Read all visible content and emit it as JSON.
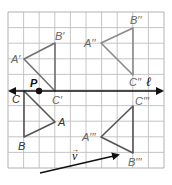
{
  "diagram": {
    "grid": {
      "left": 8,
      "top": 12,
      "cell": 15.6,
      "cols": 10,
      "rows": 10,
      "line_color": "#bfbfbf",
      "border_color": "#a8a8a8"
    },
    "line_l": {
      "label": "ℓ",
      "x1": 10,
      "x2": 162,
      "y": 91,
      "color": "#111111"
    },
    "point_P": {
      "label": "P",
      "x": 39,
      "y": 91
    },
    "vector_v": {
      "label": "v",
      "arrow_glyph": "→",
      "x1": 40,
      "y1": 173,
      "x2": 118,
      "y2": 155
    },
    "triangles": [
      {
        "name": "ABC",
        "color": "#555555",
        "vertices": {
          "A": [
            55,
            122
          ],
          "B": [
            24,
            137
          ],
          "C": [
            24,
            91
          ]
        },
        "labels": {
          "A": "A",
          "B": "B",
          "C": "C"
        }
      },
      {
        "name": "A'B'C'",
        "color": "#707070",
        "vertices": {
          "A": [
            24,
            59
          ],
          "B": [
            55,
            43
          ],
          "C": [
            55,
            91
          ]
        },
        "labels": {
          "A": "A′",
          "B": "B′",
          "C": "C′"
        }
      },
      {
        "name": "A''B''C''",
        "color": "#8a8a8a",
        "vertices": {
          "A": [
            101,
            43
          ],
          "B": [
            133,
            28
          ],
          "C": [
            133,
            75
          ]
        },
        "labels": {
          "A": "A′′",
          "B": "B′′",
          "C": "C′′"
        }
      },
      {
        "name": "A'''B'''C'''",
        "color": "#555555",
        "vertices": {
          "A": [
            101,
            137
          ],
          "B": [
            133,
            153
          ],
          "C": [
            133,
            106
          ]
        },
        "labels": {
          "A": "A′′′",
          "B": "B′′′",
          "C": "C′′′"
        }
      }
    ]
  }
}
